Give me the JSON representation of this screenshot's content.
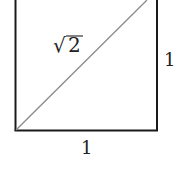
{
  "diagram": {
    "type": "unit-square-with-diagonal",
    "side_bottom_label": "1",
    "side_right_label": "1",
    "diagonal_label_radical": "√",
    "diagonal_label_radicand": "2",
    "diagonal_label_full": "√2",
    "colors": {
      "square_stroke": "#1a1a1a",
      "diagonal_stroke": "#8a8a8a",
      "background": "#ffffff"
    }
  }
}
